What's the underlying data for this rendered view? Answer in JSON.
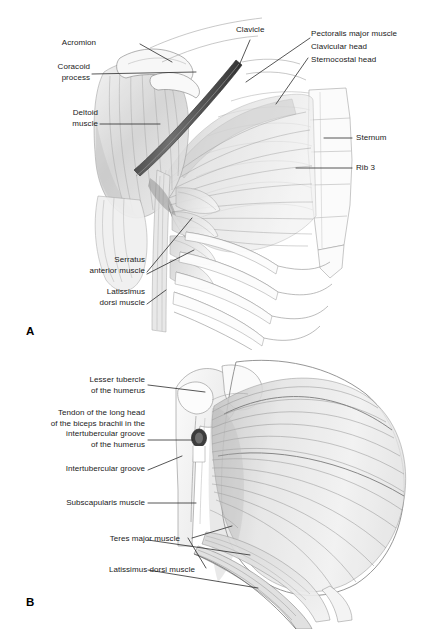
{
  "figure": {
    "background_color": "#ffffff",
    "label_color": "#1a1a1a",
    "leader_color": "#2b2b2b"
  },
  "panels": [
    {
      "id": "A",
      "letter": "A",
      "caption": "Superficial anterior chest wall: pectoralis major, deltoid, serratus anterior and ribs",
      "labels": [
        {
          "name": "acromion",
          "text": "Acromion",
          "align": "right"
        },
        {
          "name": "coracoid-process",
          "text": "Coracoid\nprocess",
          "align": "right"
        },
        {
          "name": "deltoid-muscle",
          "text": "Deltoid\nmuscle",
          "align": "right"
        },
        {
          "name": "serratus-anterior",
          "text": "Serratus\nanterior muscle",
          "align": "right"
        },
        {
          "name": "latissimus-dorsi",
          "text": "Latissimus\ndorsi muscle",
          "align": "right"
        },
        {
          "name": "clavicle",
          "text": "Clavicle",
          "align": "left"
        },
        {
          "name": "pectoralis-major",
          "text": "Pectoralis major muscle",
          "align": "left"
        },
        {
          "name": "clavicular-head",
          "text": "Clavicular head",
          "align": "left"
        },
        {
          "name": "sternocostal-head",
          "text": "Sternocostal head",
          "align": "left"
        },
        {
          "name": "sternum",
          "text": "Sternum",
          "align": "left"
        },
        {
          "name": "rib-3",
          "text": "Rib 3",
          "align": "left"
        }
      ]
    },
    {
      "id": "B",
      "letter": "B",
      "caption": "Deep anterior shoulder: subscapularis, teres major and latissimus dorsi with humerus",
      "labels": [
        {
          "name": "lesser-tubercle",
          "text": "Lesser tubercle\nof the humerus",
          "align": "right"
        },
        {
          "name": "biceps-tendon",
          "text": "Tendon of the long head\nof the biceps brachii in the\nintertubercular groove\nof the humerus",
          "align": "right"
        },
        {
          "name": "intertubercular-groove",
          "text": "Intertubercular groove",
          "align": "right"
        },
        {
          "name": "subscapularis-muscle",
          "text": "Subscapularis muscle",
          "align": "right"
        },
        {
          "name": "teres-major-muscle",
          "text": "Teres major muscle",
          "align": "right"
        },
        {
          "name": "latissimus-dorsi-muscle",
          "text": "Latissimus dorsi muscle",
          "align": "right"
        }
      ]
    }
  ]
}
